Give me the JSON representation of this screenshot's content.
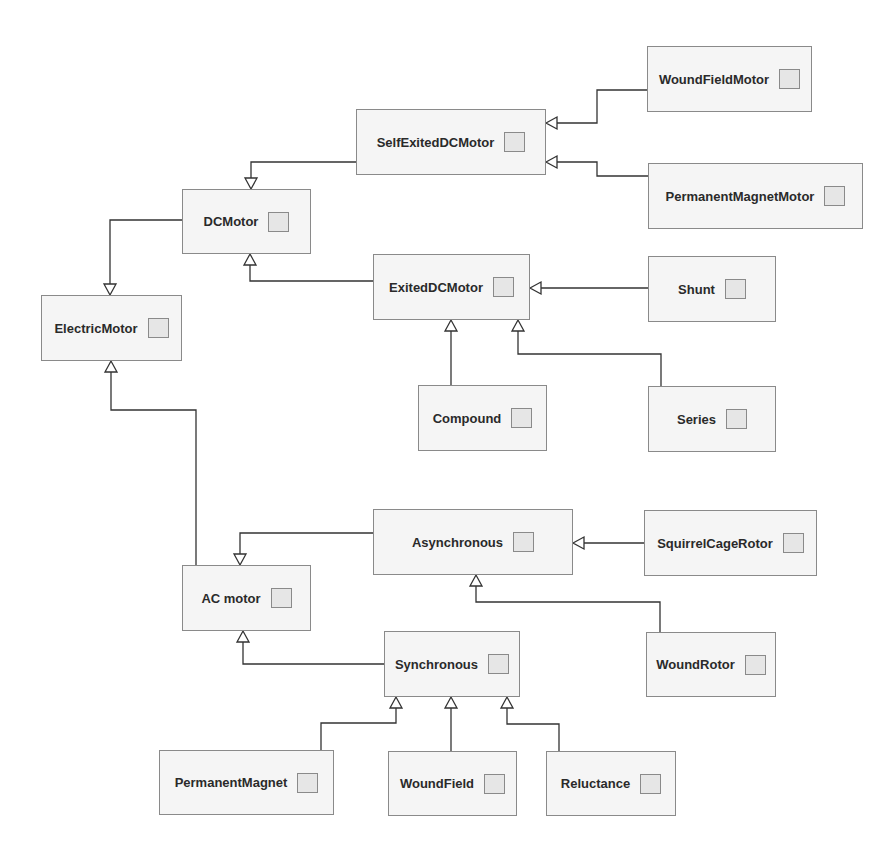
{
  "diagram": {
    "type": "uml-class-inheritance",
    "colors": {
      "background": "#ffffff",
      "node_fill": "#f5f5f5",
      "node_border": "#8a8a8a",
      "icon_fill": "#e6e6e6",
      "edge": "#333333",
      "text": "#2a2a2a"
    },
    "nodes": {
      "electric_motor": {
        "label": "ElectricMotor",
        "x": 41,
        "y": 295,
        "w": 141,
        "h": 66
      },
      "dc_motor": {
        "label": "DCMotor",
        "x": 182,
        "y": 189,
        "w": 129,
        "h": 65
      },
      "self_exited_dc_motor": {
        "label": "SelfExitedDCMotor",
        "x": 356,
        "y": 109,
        "w": 190,
        "h": 66
      },
      "wound_field_motor": {
        "label": "WoundFieldMotor",
        "x": 647,
        "y": 46,
        "w": 165,
        "h": 66
      },
      "permanent_magnet_motor": {
        "label": "PermanentMagnetMotor",
        "x": 648,
        "y": 163,
        "w": 215,
        "h": 66
      },
      "exited_dc_motor": {
        "label": "ExitedDCMotor",
        "x": 373,
        "y": 254,
        "w": 157,
        "h": 66
      },
      "shunt": {
        "label": "Shunt",
        "x": 648,
        "y": 256,
        "w": 128,
        "h": 66
      },
      "compound": {
        "label": "Compound",
        "x": 418,
        "y": 385,
        "w": 129,
        "h": 66
      },
      "series": {
        "label": "Series",
        "x": 648,
        "y": 386,
        "w": 128,
        "h": 66
      },
      "ac_motor": {
        "label": "AC motor",
        "x": 182,
        "y": 565,
        "w": 129,
        "h": 66
      },
      "asynchronous": {
        "label": "Asynchronous",
        "x": 373,
        "y": 509,
        "w": 200,
        "h": 66
      },
      "squirrel_cage_rotor": {
        "label": "SquirrelCageRotor",
        "x": 644,
        "y": 510,
        "w": 173,
        "h": 66
      },
      "wound_rotor": {
        "label": "WoundRotor",
        "x": 646,
        "y": 632,
        "w": 130,
        "h": 65
      },
      "synchronous": {
        "label": "Synchronous",
        "x": 384,
        "y": 631,
        "w": 136,
        "h": 66
      },
      "permanent_magnet": {
        "label": "PermanentMagnet",
        "x": 159,
        "y": 750,
        "w": 175,
        "h": 65
      },
      "wound_field": {
        "label": "WoundField",
        "x": 388,
        "y": 751,
        "w": 129,
        "h": 65
      },
      "reluctance": {
        "label": "Reluctance",
        "x": 546,
        "y": 751,
        "w": 130,
        "h": 65
      }
    },
    "edges": [
      {
        "from": "DCMotor",
        "to": "ElectricMotor",
        "points": [
          [
            182,
            220
          ],
          [
            110,
            220
          ],
          [
            110,
            295
          ]
        ],
        "arrow": "down"
      },
      {
        "from": "AC motor",
        "to": "ElectricMotor",
        "points": [
          [
            196,
            565
          ],
          [
            196,
            410
          ],
          [
            111,
            410
          ],
          [
            111,
            361
          ]
        ],
        "arrow": "up"
      },
      {
        "from": "SelfExitedDCMotor",
        "to": "DCMotor",
        "points": [
          [
            356,
            162
          ],
          [
            251,
            162
          ],
          [
            251,
            189
          ]
        ],
        "arrow": "down"
      },
      {
        "from": "ExitedDCMotor",
        "to": "DCMotor",
        "points": [
          [
            373,
            281
          ],
          [
            250,
            281
          ],
          [
            250,
            254
          ]
        ],
        "arrow": "up"
      },
      {
        "from": "WoundFieldMotor",
        "to": "SelfExitedDCMotor",
        "points": [
          [
            647,
            90
          ],
          [
            597,
            90
          ],
          [
            597,
            123
          ],
          [
            546,
            123
          ]
        ],
        "arrow": "left"
      },
      {
        "from": "PermanentMagnetMotor",
        "to": "SelfExitedDCMotor",
        "points": [
          [
            648,
            176
          ],
          [
            597,
            176
          ],
          [
            597,
            162
          ],
          [
            546,
            162
          ]
        ],
        "arrow": "left"
      },
      {
        "from": "Shunt",
        "to": "ExitedDCMotor",
        "points": [
          [
            648,
            288
          ],
          [
            530,
            288
          ]
        ],
        "arrow": "left"
      },
      {
        "from": "Compound",
        "to": "ExitedDCMotor",
        "points": [
          [
            451,
            385
          ],
          [
            451,
            320
          ]
        ],
        "arrow": "up"
      },
      {
        "from": "Series",
        "to": "ExitedDCMotor",
        "points": [
          [
            661,
            386
          ],
          [
            661,
            354
          ],
          [
            518,
            354
          ],
          [
            518,
            320
          ]
        ],
        "arrow": "up"
      },
      {
        "from": "Asynchronous",
        "to": "AC motor",
        "points": [
          [
            373,
            533
          ],
          [
            240,
            533
          ],
          [
            240,
            565
          ]
        ],
        "arrow": "down"
      },
      {
        "from": "Synchronous",
        "to": "AC motor",
        "points": [
          [
            384,
            664
          ],
          [
            243,
            664
          ],
          [
            243,
            631
          ]
        ],
        "arrow": "up"
      },
      {
        "from": "SquirrelCageRotor",
        "to": "Asynchronous",
        "points": [
          [
            644,
            543
          ],
          [
            573,
            543
          ]
        ],
        "arrow": "left"
      },
      {
        "from": "WoundRotor",
        "to": "Asynchronous",
        "points": [
          [
            660,
            632
          ],
          [
            660,
            602
          ],
          [
            476,
            602
          ],
          [
            476,
            575
          ]
        ],
        "arrow": "up"
      },
      {
        "from": "PermanentMagnet",
        "to": "Synchronous",
        "points": [
          [
            321,
            750
          ],
          [
            321,
            723
          ],
          [
            396,
            723
          ],
          [
            396,
            697
          ]
        ],
        "arrow": "up"
      },
      {
        "from": "WoundField",
        "to": "Synchronous",
        "points": [
          [
            451,
            751
          ],
          [
            451,
            697
          ]
        ],
        "arrow": "up"
      },
      {
        "from": "Reluctance",
        "to": "Synchronous",
        "points": [
          [
            559,
            751
          ],
          [
            559,
            724
          ],
          [
            507,
            724
          ],
          [
            507,
            697
          ]
        ],
        "arrow": "up"
      }
    ]
  }
}
